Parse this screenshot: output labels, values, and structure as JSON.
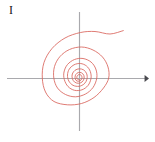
{
  "figure": {
    "label": "I",
    "background_color": "#ffffff",
    "width": 155,
    "height": 142
  },
  "axes": {
    "color": "#a9a9ad",
    "stroke_width": 1.15,
    "origin": {
      "x": 79.5,
      "y": 78.5
    },
    "x_axis": {
      "x_start": 7,
      "x_end": 149,
      "y": 78.5,
      "arrow_end": "right",
      "arrow_size": 4.2
    },
    "y_axis": {
      "y_start": 12,
      "y_end": 131,
      "x": 79.5,
      "arrow_end": "none"
    }
  },
  "curve": {
    "name": "inward-spiral",
    "color": "#d9645c",
    "stroke_width": 0.85,
    "type": "logarithmic-spiral",
    "description": "Spiral winding inward toward the origin with an outer arm sweeping up and to the right",
    "turns": 4.35,
    "theta_start_deg": 20,
    "theta_end_deg": -1545,
    "r_start": 46.5,
    "r_end": 5.2,
    "growth_rate_b": 0.0815,
    "bounds": {
      "left": 42,
      "right": 124,
      "top": 29,
      "bottom": 105
    }
  },
  "chart_data": {
    "type": "line",
    "title": "",
    "xlabel": "",
    "ylabel": "",
    "grid": false,
    "legend": null,
    "axis_style": "cartesian-cross-with-right-arrow",
    "series": [
      {
        "name": "inward-spiral",
        "color": "#d9645c",
        "parametric": "r(theta) = r0 * exp(-b * theta)",
        "r0": 46.5,
        "b": 0.0815,
        "theta_range_deg": [
          20,
          -1545
        ],
        "origin_px": [
          79.5,
          78.5
        ],
        "sample_points_px": [
          [
            123.3,
            30.6
          ],
          [
            110.0,
            34.0
          ],
          [
            95.0,
            31.5
          ],
          [
            80.5,
            32.5
          ],
          [
            65.0,
            38.0
          ],
          [
            52.0,
            48.5
          ],
          [
            44.0,
            62.5
          ],
          [
            42.3,
            78.0
          ],
          [
            45.5,
            92.0
          ],
          [
            54.0,
            101.5
          ],
          [
            67.5,
            104.8
          ],
          [
            81.5,
            103.5
          ],
          [
            94.0,
            97.5
          ],
          [
            103.5,
            88.0
          ],
          [
            108.7,
            78.0
          ],
          [
            108.0,
            67.0
          ],
          [
            102.5,
            57.0
          ],
          [
            93.0,
            50.0
          ],
          [
            81.5,
            47.0
          ],
          [
            69.5,
            49.5
          ],
          [
            60.0,
            56.5
          ],
          [
            54.5,
            66.5
          ],
          [
            53.8,
            78.0
          ],
          [
            57.5,
            88.0
          ],
          [
            65.5,
            94.5
          ],
          [
            75.5,
            96.8
          ],
          [
            85.5,
            94.0
          ],
          [
            93.0,
            87.5
          ],
          [
            96.8,
            78.0
          ],
          [
            95.8,
            69.0
          ],
          [
            91.0,
            62.0
          ],
          [
            83.0,
            58.5
          ],
          [
            74.5,
            59.5
          ],
          [
            67.5,
            64.5
          ],
          [
            64.0,
            72.0
          ],
          [
            64.3,
            79.5
          ],
          [
            68.0,
            86.5
          ],
          [
            74.5,
            90.3
          ],
          [
            82.0,
            89.8
          ],
          [
            88.0,
            85.5
          ],
          [
            91.0,
            78.5
          ],
          [
            90.3,
            71.5
          ],
          [
            86.5,
            66.0
          ],
          [
            80.5,
            63.5
          ],
          [
            74.0,
            64.8
          ],
          [
            69.3,
            69.0
          ],
          [
            67.5,
            75.0
          ],
          [
            68.8,
            81.0
          ],
          [
            73.0,
            85.3
          ],
          [
            79.0,
            86.3
          ],
          [
            84.3,
            83.8
          ],
          [
            87.0,
            79.0
          ],
          [
            86.7,
            73.8
          ],
          [
            83.8,
            70.0
          ],
          [
            79.3,
            68.8
          ],
          [
            75.0,
            70.3
          ],
          [
            72.3,
            74.0
          ],
          [
            72.3,
            78.5
          ],
          [
            74.5,
            82.0
          ],
          [
            78.3,
            83.3
          ],
          [
            82.0,
            82.0
          ],
          [
            84.0,
            78.8
          ],
          [
            83.8,
            75.3
          ],
          [
            81.5,
            72.8
          ],
          [
            78.3,
            72.5
          ],
          [
            75.8,
            74.5
          ],
          [
            75.0,
            77.5
          ],
          [
            76.0,
            80.3
          ],
          [
            78.5,
            81.3
          ],
          [
            81.0,
            80.0
          ],
          [
            82.0,
            77.5
          ],
          [
            81.2,
            75.3
          ],
          [
            79.3,
            74.5
          ],
          [
            77.5,
            75.5
          ],
          [
            76.8,
            77.5
          ],
          [
            77.6,
            79.3
          ],
          [
            79.4,
            79.8
          ]
        ]
      }
    ]
  }
}
